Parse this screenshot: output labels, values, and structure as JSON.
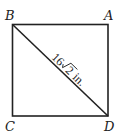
{
  "diagram": {
    "type": "square-with-diagonal",
    "colors": {
      "stroke": "#222222",
      "background": "#ffffff"
    },
    "vertices": {
      "A": {
        "label": "A",
        "position": "top-right"
      },
      "B": {
        "label": "B",
        "position": "top-left"
      },
      "C": {
        "label": "C",
        "position": "bottom-left"
      },
      "D": {
        "label": "D",
        "position": "bottom-right"
      }
    },
    "diagonal": {
      "from": "B",
      "to": "D",
      "label_number": "16",
      "label_radicand": "2",
      "label_unit": "in.",
      "label_full": "16√2 in."
    }
  }
}
